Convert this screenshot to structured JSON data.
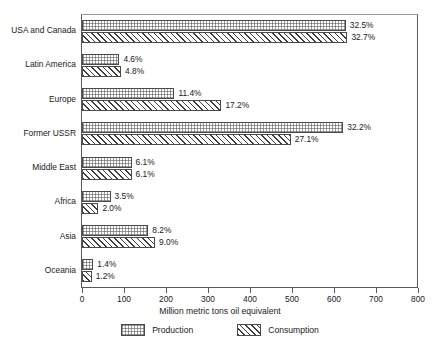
{
  "chart_data": {
    "type": "bar",
    "orientation": "horizontal",
    "title": "",
    "xlabel": "Million metric tons oil equivalent",
    "ylabel": "",
    "xlim": [
      0,
      800
    ],
    "xticks": [
      0,
      100,
      200,
      300,
      400,
      500,
      600,
      700,
      800
    ],
    "xticklabels": [
      "0",
      "100",
      "200",
      "300",
      "400",
      "500",
      "600",
      "700",
      "800"
    ],
    "grid": false,
    "legend_position": "bottom",
    "categories": [
      "USA and Canada",
      "Latin America",
      "Europe",
      "Former USSR",
      "Middle East",
      "Africa",
      "Asia",
      "Oceania"
    ],
    "series": [
      {
        "name": "Production",
        "pattern": "cross-hatch",
        "values": [
          628,
          89,
          220,
          622,
          118,
          68,
          158,
          27
        ],
        "labels": [
          "32.5%",
          "4.6%",
          "11.4%",
          "32.2%",
          "6.1%",
          "3.5%",
          "8.2%",
          "1.4%"
        ]
      },
      {
        "name": "Consumption",
        "pattern": "diagonal-stripe",
        "values": [
          632,
          93,
          332,
          497,
          118,
          39,
          174,
          23
        ],
        "labels": [
          "32.7%",
          "4.8%",
          "17.2%",
          "27.1%",
          "6.1%",
          "2.0%",
          "9.0%",
          "1.2%"
        ]
      }
    ],
    "legend": [
      "Production",
      "Consumption"
    ],
    "colors": {
      "bar_outline": "#4a4a4a",
      "frame": "#5a5a5a",
      "text": "#1a1a1a",
      "background": "#ffffff"
    }
  }
}
